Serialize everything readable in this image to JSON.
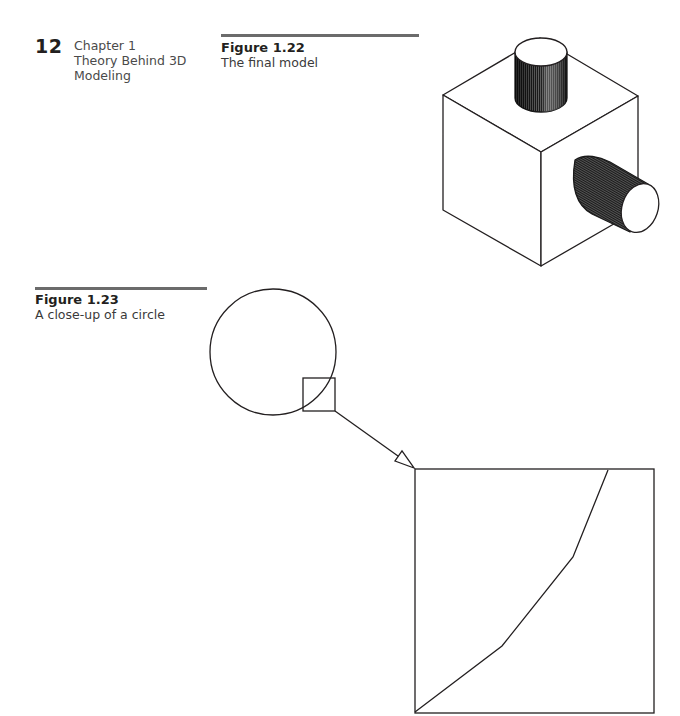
{
  "page": {
    "number": "12",
    "running_head": {
      "line1": "Chapter 1",
      "line2": "Theory Behind 3D",
      "line3": "Modeling"
    }
  },
  "figures": [
    {
      "label": "Figure 1.22",
      "caption": "The final model",
      "illustration": "cube-with-two-cylinders"
    },
    {
      "label": "Figure 1.23",
      "caption": "A close-up of a circle",
      "illustration": "circle-closeup-with-magnified-square"
    }
  ]
}
